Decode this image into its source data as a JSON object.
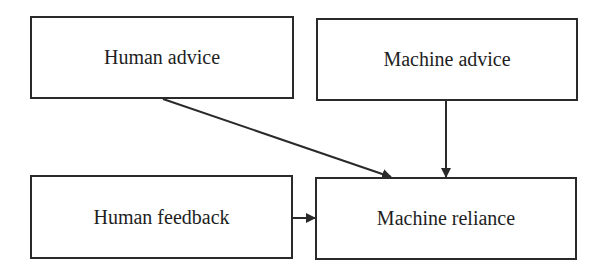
{
  "diagram": {
    "nodes": [
      {
        "id": "human_advice",
        "label": "Human advice",
        "x": 30,
        "y": 16,
        "w": 264,
        "h": 83
      },
      {
        "id": "machine_advice",
        "label": "Machine advice",
        "x": 316,
        "y": 18,
        "w": 262,
        "h": 83
      },
      {
        "id": "human_feedback",
        "label": "Human feedback",
        "x": 30,
        "y": 175,
        "w": 263,
        "h": 84
      },
      {
        "id": "machine_reliance",
        "label": "Machine reliance",
        "x": 315,
        "y": 177,
        "w": 262,
        "h": 83
      }
    ],
    "edges": [
      {
        "from": "human_advice",
        "to": "machine_reliance"
      },
      {
        "from": "machine_advice",
        "to": "machine_reliance"
      },
      {
        "from": "human_feedback",
        "to": "machine_reliance"
      }
    ],
    "colors": {
      "stroke": "#2a2a2a",
      "text": "#1e1e1e",
      "background": "#ffffff"
    }
  }
}
